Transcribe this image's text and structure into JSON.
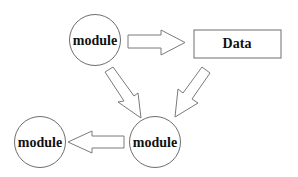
{
  "diagram": {
    "title": "",
    "nodes": [
      {
        "id": "module_top",
        "type": "circle",
        "label": "module"
      },
      {
        "id": "data",
        "type": "rectangle",
        "label": "Data"
      },
      {
        "id": "module_bottom_right",
        "type": "circle",
        "label": "module"
      },
      {
        "id": "module_bottom_left",
        "type": "circle",
        "label": "module"
      }
    ],
    "edges": [
      {
        "from": "module_top",
        "to": "data",
        "style": "hollow-block-arrow"
      },
      {
        "from": "module_top",
        "to": "module_bottom_right",
        "style": "hollow-block-arrow"
      },
      {
        "from": "data",
        "to": "module_bottom_right",
        "style": "hollow-block-arrow"
      },
      {
        "from": "module_bottom_right",
        "to": "module_bottom_left",
        "style": "hollow-block-arrow"
      }
    ],
    "colors": {
      "stroke": "#6e6e6e",
      "fill": "#ffffff",
      "text": "#111111"
    }
  }
}
